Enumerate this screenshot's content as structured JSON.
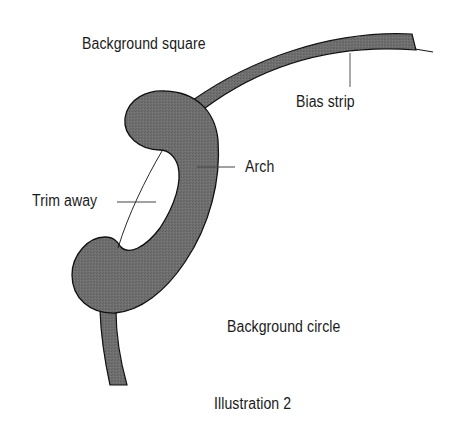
{
  "diagram": {
    "labels": {
      "background_square": "Background square",
      "bias_strip": "Bias strip",
      "arch": "Arch",
      "trim_away": "Trim away",
      "background_circle": "Background circle"
    },
    "caption": "Illustration 2"
  },
  "colors": {
    "fill": "#6e6e6e",
    "outline": "#111111",
    "leader": "#444444",
    "background": "#ffffff"
  }
}
